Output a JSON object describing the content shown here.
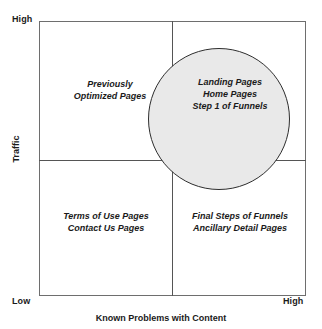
{
  "chart_data": {
    "type": "scatter",
    "title": "",
    "xlabel": "Known Problems with Content",
    "ylabel": "Traffic",
    "x_tick_labels": [
      "Low",
      "High"
    ],
    "y_tick_labels": [
      "Low",
      "High"
    ],
    "grid": true,
    "legend": "none",
    "quadrants": [
      {
        "position": "top-left",
        "x_level": "Low",
        "y_level": "High",
        "lines": [
          "Previously",
          "Optimized Pages"
        ]
      },
      {
        "position": "top-right",
        "x_level": "High",
        "y_level": "High",
        "lines": [
          "Landing Pages",
          "Home Pages",
          "Step 1 of Funnels"
        ]
      },
      {
        "position": "bottom-left",
        "x_level": "Low",
        "y_level": "Low",
        "lines": [
          "Terms of Use Pages",
          "Contact Us Pages"
        ]
      },
      {
        "position": "bottom-right",
        "x_level": "High",
        "y_level": "Low",
        "lines": [
          "Final Steps of Funnels",
          "Ancillary Detail Pages"
        ]
      }
    ],
    "annotations": [
      {
        "shape": "circle",
        "label": "priority-focus-region",
        "center_x_fraction": 0.674,
        "center_y_fraction": 0.357,
        "radius_fraction": 0.266,
        "fill": "#e9e9e9",
        "stroke": "#2e2e2e"
      }
    ]
  },
  "axes": {
    "y_high_label": "High",
    "y_title": "Traffic",
    "x_low_label": "Low",
    "x_high_label": "High",
    "x_title": "Known Problems with Content"
  },
  "quadrant_text": {
    "top_left": {
      "line1": "Previously",
      "line2": "Optimized Pages"
    },
    "top_right": {
      "line1": "Landing Pages",
      "line2": "Home Pages",
      "line3": "Step 1 of Funnels"
    },
    "bottom_left": {
      "line1": "Terms of Use Pages",
      "line2": "Contact Us Pages"
    },
    "bottom_right": {
      "line1": "Final Steps of Funnels",
      "line2": "Ancillary Detail Pages"
    }
  },
  "colors": {
    "frame_stroke": "#6e6e6e",
    "divider_stroke": "#555555",
    "circle_fill": "#e9e9e9",
    "circle_stroke": "#2e2e2e",
    "text": "#1a1a1a",
    "background": "#ffffff"
  }
}
